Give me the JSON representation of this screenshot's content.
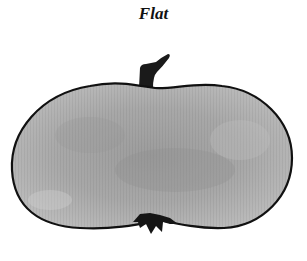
{
  "figure": {
    "caption": "Flat",
    "colors": {
      "fill": "#a8a8a8",
      "fill_light": "#c4c4c4",
      "fill_dark": "#8e8e8e",
      "outline": "#111111",
      "stem": "#1a1a1a",
      "background": "#ffffff"
    }
  }
}
